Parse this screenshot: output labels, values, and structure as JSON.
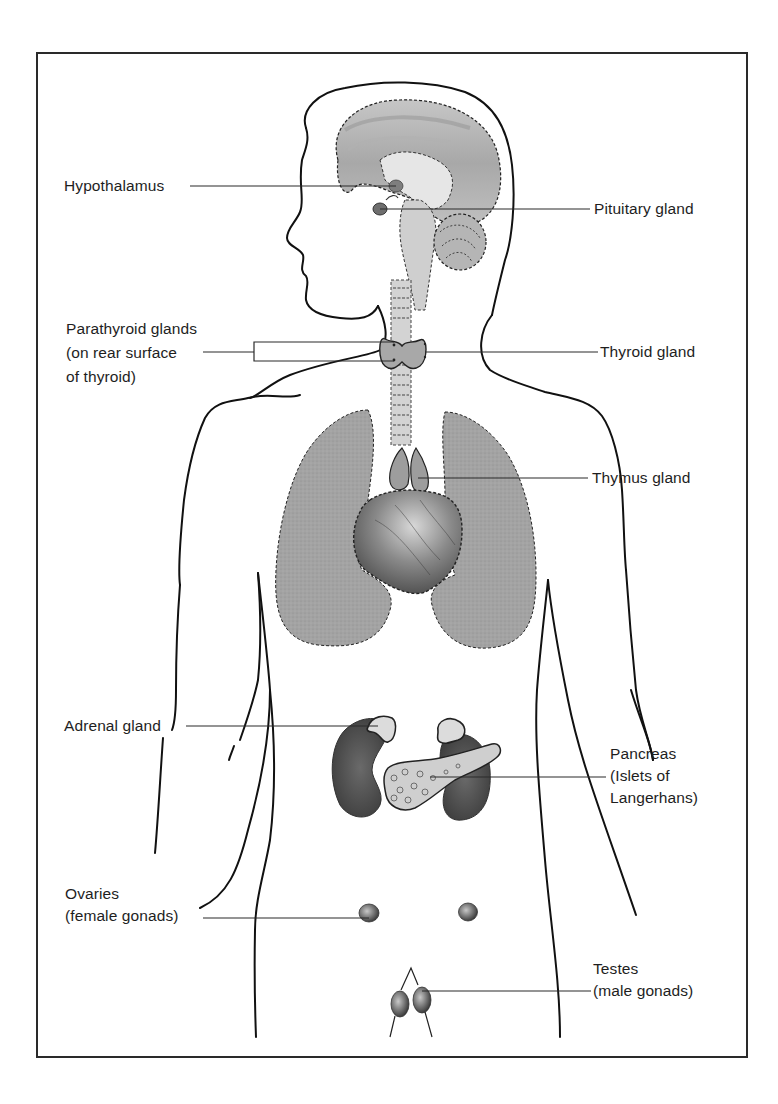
{
  "figure": {
    "type": "anatomical-diagram",
    "colors": {
      "outline": "#1a1a1a",
      "organ_fill": "#9a9a9a",
      "dark_organ_fill": "#5a5a5a",
      "light_tissue": "#d6d6d6",
      "background": "#ffffff"
    }
  },
  "labels": {
    "hypothalamus": {
      "text": "Hypothalamus"
    },
    "pituitary": {
      "text": "Pituitary gland"
    },
    "parathyroid": {
      "lines": [
        "Parathyroid glands",
        "(on rear surface",
        "of thyroid)"
      ]
    },
    "thyroid": {
      "text": "Thyroid gland"
    },
    "thymus": {
      "text": "Thymus gland"
    },
    "adrenal": {
      "text": "Adrenal gland"
    },
    "pancreas": {
      "lines": [
        "Pancreas",
        "(Islets of",
        "Langerhans)"
      ]
    },
    "ovaries": {
      "lines": [
        "Ovaries",
        "(female gonads)"
      ]
    },
    "testes": {
      "lines": [
        "Testes",
        "(male gonads)"
      ]
    }
  }
}
